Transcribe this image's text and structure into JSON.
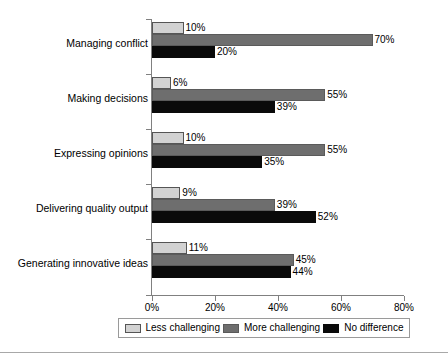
{
  "chart_data": {
    "type": "bar",
    "orientation": "horizontal",
    "title": "",
    "subtitle": "",
    "xlabel": "",
    "ylabel": "",
    "xlim": [
      0,
      80
    ],
    "x_ticks": [
      0,
      20,
      40,
      60,
      80
    ],
    "x_tick_labels": [
      "0%",
      "20%",
      "40%",
      "60%",
      "80%"
    ],
    "grid": false,
    "legend_position": "bottom",
    "value_label_suffix": "%",
    "categories": [
      "Managing conflict",
      "Making decisions",
      "Expressing opinions",
      "Delivering quality output",
      "Generating innovative ideas"
    ],
    "series": [
      {
        "name": "Less challenging",
        "color": "#d2d2d2",
        "values": [
          10,
          6,
          10,
          9,
          11
        ],
        "labels": [
          "10%",
          "6%",
          "10%",
          "9%",
          "11%"
        ]
      },
      {
        "name": "More challenging",
        "color": "#6e6e6e",
        "values": [
          70,
          55,
          55,
          39,
          45
        ],
        "labels": [
          "70%",
          "55%",
          "55%",
          "39%",
          "45%"
        ]
      },
      {
        "name": "No difference",
        "color": "#0a0a0a",
        "values": [
          20,
          39,
          35,
          52,
          44
        ],
        "labels": [
          "20%",
          "39%",
          "35%",
          "52%",
          "44%"
        ]
      }
    ]
  },
  "legend": {
    "items": [
      {
        "label": "Less challenging"
      },
      {
        "label": "More challenging"
      },
      {
        "label": "No difference"
      }
    ]
  }
}
